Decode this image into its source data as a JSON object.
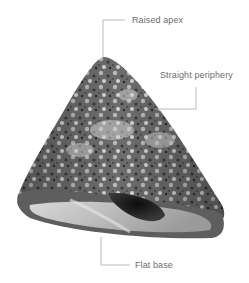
{
  "figure": {
    "callouts": [
      {
        "id": "apex",
        "label": "Raised apex"
      },
      {
        "id": "periphery",
        "label": "Straight periphery"
      },
      {
        "id": "base",
        "label": "Flat base"
      }
    ],
    "colors": {
      "background": "#ffffff",
      "leader_line": "#a8a8a8",
      "label_text": "#6e6e6e"
    }
  }
}
